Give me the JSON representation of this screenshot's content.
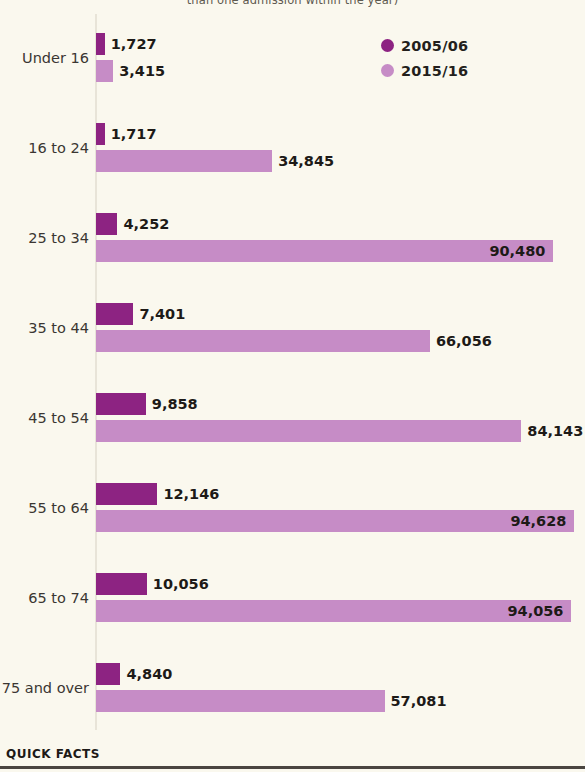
{
  "chart_data": {
    "type": "bar",
    "orientation": "horizontal",
    "title": "than one admission within the year)",
    "xlabel": "",
    "ylabel": "",
    "grid": false,
    "legend_position": "top-right",
    "xlim": [
      0,
      97000
    ],
    "categories": [
      "Under 16",
      "16 to 24",
      "25 to 34",
      "35 to 44",
      "45 to 54",
      "55 to 64",
      "65 to 74",
      "75 and over"
    ],
    "series": [
      {
        "name": "2005/06",
        "color": "#8d2382",
        "values": [
          1727,
          1717,
          4252,
          7401,
          9858,
          12146,
          10056,
          4840
        ],
        "labels": [
          "1,727",
          "1,717",
          "4,252",
          "7,401",
          "9,858",
          "12,146",
          "10,056",
          "4,840"
        ]
      },
      {
        "name": "2015/16",
        "color": "#c68cc6",
        "values": [
          3415,
          34845,
          90480,
          66056,
          84143,
          94628,
          94056,
          57081
        ],
        "labels": [
          "3,415",
          "34,845",
          "90,480",
          "66,056",
          "84,143",
          "94,628",
          "94,056",
          "57,081"
        ]
      }
    ]
  },
  "legend": {
    "items": [
      {
        "label": "2005/06",
        "color": "#8d2382"
      },
      {
        "label": "2015/16",
        "color": "#c68cc6"
      }
    ]
  },
  "footer": {
    "label": "QUICK FACTS"
  },
  "colors": {
    "background": "#faf8ee",
    "series_2005_06": "#8d2382",
    "series_2015_16": "#c68cc6",
    "axis": "#e8e4d8",
    "text": "#1d1a17",
    "rule": "#4a4540"
  }
}
